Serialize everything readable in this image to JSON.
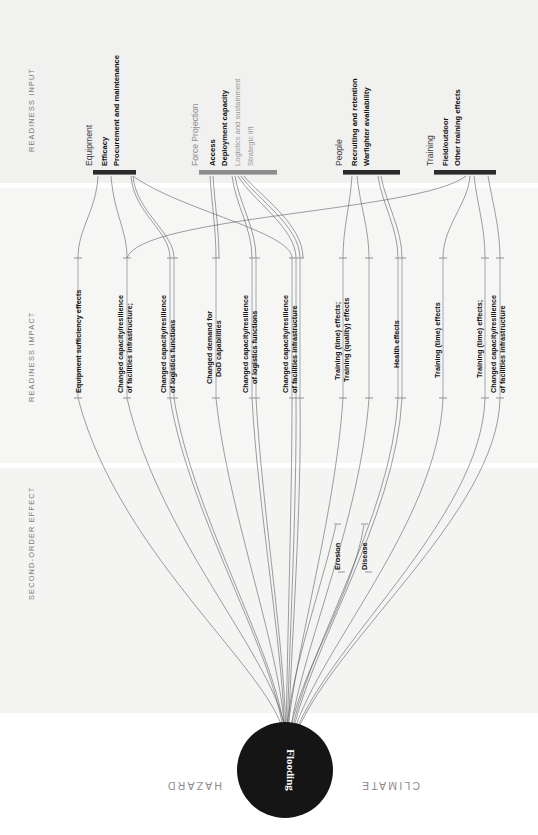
{
  "figure": {
    "hazard_category": "CLIMATE",
    "hazard_word": "HAZARD",
    "hub_label": "Flooding",
    "hub_color": "#151515"
  },
  "bands": [
    {
      "id": "readiness-input",
      "label": "READINESS INPUT"
    },
    {
      "id": "readiness-impact",
      "label": "READINESS IMPACT"
    },
    {
      "id": "second-order-effect",
      "label": "SECOND-ORDER EFFECT"
    }
  ],
  "input_groups": [
    {
      "id": "equipment",
      "title": "Equipment",
      "bar_color": "#2b2b2b",
      "active": true,
      "items": [
        {
          "label": "Efficacy",
          "active": true
        },
        {
          "label": "Procurement and maintenance",
          "active": true
        }
      ]
    },
    {
      "id": "force-projection",
      "title": "Force Projection",
      "bar_color": "#8d8d8d",
      "active": false,
      "items": [
        {
          "label": "Access",
          "active": true
        },
        {
          "label": "Deployment capacity",
          "active": true
        },
        {
          "label": "Logistics and sustainment",
          "active": false
        },
        {
          "label": "Strategic lift",
          "active": false
        }
      ]
    },
    {
      "id": "people",
      "title": "People",
      "bar_color": "#2b2b2b",
      "active": true,
      "items": [
        {
          "label": "Recruiting and retention",
          "active": true
        },
        {
          "label": "Warfighter availability",
          "active": true
        }
      ]
    },
    {
      "id": "training",
      "title": "Training",
      "bar_color": "#2b2b2b",
      "active": true,
      "items": [
        {
          "label": "Field/outdoor",
          "active": true
        },
        {
          "label": "Other training effects",
          "active": true
        }
      ]
    }
  ],
  "impact_nodes": [
    {
      "id": "i1",
      "lines": [
        "Equipment sufficiency effects"
      ]
    },
    {
      "id": "i2",
      "lines": [
        "Changed capacity/resilience",
        "of facilities infrastructure;"
      ]
    },
    {
      "id": "i3",
      "lines": [
        "Changed capacity/resilience",
        "of logistics functions"
      ]
    },
    {
      "id": "i4",
      "lines": [
        "Changed demand for",
        "DoD capabilities"
      ]
    },
    {
      "id": "i5",
      "lines": [
        "Changed capacity/resilience",
        "of logistics functions"
      ]
    },
    {
      "id": "i6",
      "lines": [
        "Changed capacity/resilience",
        "of facilities infrastructure"
      ]
    },
    {
      "id": "i7",
      "lines": [
        "Training (time) effects;"
      ]
    },
    {
      "id": "i8",
      "lines": [
        "Training (quality) effects"
      ]
    },
    {
      "id": "i9",
      "lines": [
        "Health effects"
      ]
    },
    {
      "id": "i10",
      "lines": [
        "Training (time) effects"
      ]
    },
    {
      "id": "i11",
      "lines": [
        "Training (time) effects;"
      ]
    },
    {
      "id": "i12",
      "lines": [
        "Changed capacity/resilience",
        "of facilities infrastructure"
      ]
    }
  ],
  "second_order_nodes": [
    {
      "id": "s1",
      "label": "Erosion"
    },
    {
      "id": "s2",
      "label": "Disease"
    }
  ]
}
